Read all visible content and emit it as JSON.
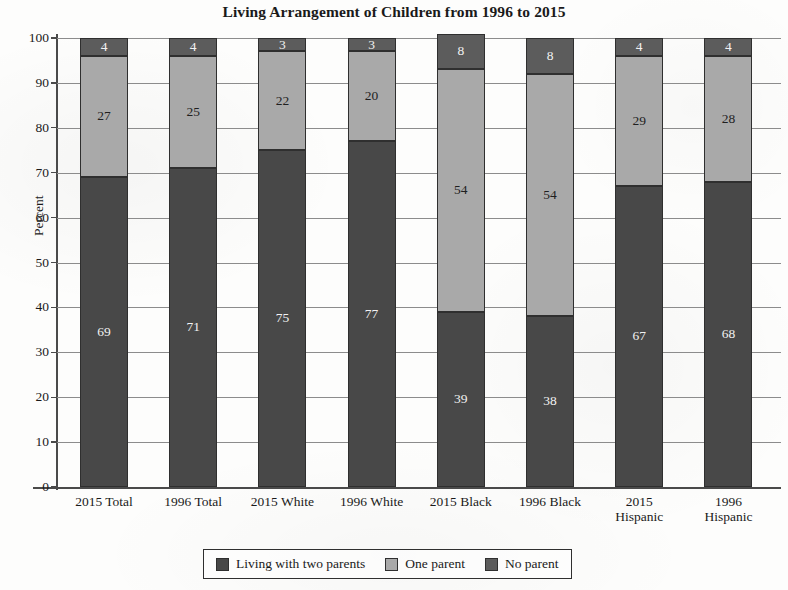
{
  "chart_data": {
    "type": "bar",
    "subtype": "stacked-bar-100",
    "title": "Living Arrangement of Children from 1996 to 2015",
    "xlabel": "",
    "ylabel": "Percent",
    "ylim": [
      0,
      100
    ],
    "yticks": [
      0,
      10,
      20,
      30,
      40,
      50,
      60,
      70,
      80,
      90,
      100
    ],
    "grid": "horizontal",
    "legend_position": "bottom",
    "categories": [
      "2015 Total",
      "1996 Total",
      "2015 White",
      "1996 White",
      "2015 Black",
      "1996 Black",
      "2015 Hispanic",
      "1996 Hispanic"
    ],
    "category_lines": [
      [
        "2015 Total",
        ""
      ],
      [
        "1996 Total",
        ""
      ],
      [
        "2015 White",
        ""
      ],
      [
        "1996 White",
        ""
      ],
      [
        "2015 Black",
        ""
      ],
      [
        "1996 Black",
        ""
      ],
      [
        "2015",
        "Hispanic"
      ],
      [
        "1996",
        "Hispanic"
      ]
    ],
    "series": [
      {
        "name": "Living with two parents",
        "color": "#484848",
        "values": [
          69,
          71,
          75,
          77,
          39,
          38,
          67,
          68
        ]
      },
      {
        "name": "One parent",
        "color": "#a9a9a9",
        "values": [
          27,
          25,
          22,
          20,
          54,
          54,
          29,
          28
        ]
      },
      {
        "name": "No parent",
        "color": "#5c5c5c",
        "values": [
          4,
          4,
          3,
          3,
          8,
          8,
          4,
          4
        ]
      }
    ]
  },
  "legend": {
    "entries": [
      {
        "label": "Living with two parents",
        "color": "#484848"
      },
      {
        "label": "One parent",
        "color": "#a9a9a9"
      },
      {
        "label": "No parent",
        "color": "#5c5c5c"
      }
    ]
  }
}
